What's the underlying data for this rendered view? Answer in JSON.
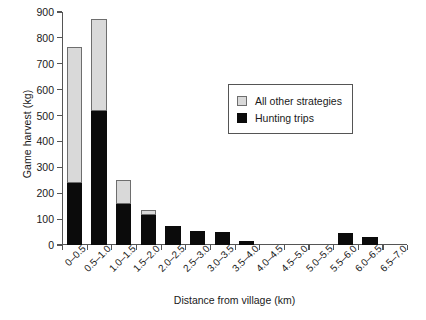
{
  "chart_data": {
    "type": "bar",
    "stacked": true,
    "title": "",
    "xlabel": "Distance from village (km)",
    "ylabel": "Game harvest (kg)",
    "ylim": [
      0,
      900
    ],
    "yticks": [
      0,
      100,
      200,
      300,
      400,
      500,
      600,
      700,
      800,
      900
    ],
    "grid": false,
    "legend_position": "upper-right-inside",
    "categories": [
      "0–0.5",
      "0.5–1.0",
      "1.0–1.5",
      "1.5–2.0",
      "2.0–2.5",
      "2.5–3.0",
      "3.0–3.5",
      "3.5–4.0",
      "4.0–4.5",
      "4.5–5.0",
      "5.0–5.5",
      "5.5–6.0",
      "6.0–6.5",
      "6.5–7.0"
    ],
    "series": [
      {
        "name": "Hunting trips",
        "color": "#0b0b0b",
        "values": [
          240,
          518,
          160,
          115,
          72,
          55,
          50,
          15,
          0,
          0,
          0,
          45,
          30,
          0
        ]
      },
      {
        "name": "All other strategies",
        "color": "#d9d9d9",
        "values": [
          525,
          355,
          90,
          20,
          0,
          0,
          0,
          0,
          0,
          0,
          0,
          0,
          0,
          0
        ]
      }
    ],
    "totals": [
      765,
      873,
      250,
      135,
      72,
      55,
      50,
      15,
      0,
      0,
      0,
      45,
      30,
      0
    ]
  },
  "legend": {
    "items": [
      {
        "label": "All other strategies",
        "swatch": "gray"
      },
      {
        "label": "Hunting trips",
        "swatch": "black"
      }
    ]
  }
}
